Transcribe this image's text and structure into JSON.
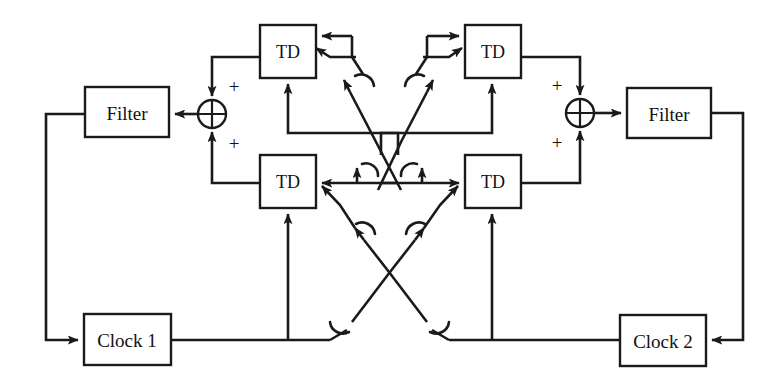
{
  "diagram": {
    "type": "block-diagram",
    "blocks": [
      {
        "id": "filter_left",
        "label": "Filter",
        "x": 85,
        "y": 87,
        "w": 84,
        "h": 50
      },
      {
        "id": "filter_right",
        "label": "Filter",
        "x": 627,
        "y": 88,
        "w": 84,
        "h": 50
      },
      {
        "id": "td_tl",
        "label": "TD",
        "x": 260,
        "y": 25,
        "w": 56,
        "h": 53
      },
      {
        "id": "td_bl",
        "label": "TD",
        "x": 260,
        "y": 155,
        "w": 56,
        "h": 53
      },
      {
        "id": "td_tr",
        "label": "TD",
        "x": 465,
        "y": 25,
        "w": 56,
        "h": 53
      },
      {
        "id": "td_br",
        "label": "TD",
        "x": 465,
        "y": 155,
        "w": 56,
        "h": 53
      },
      {
        "id": "clock1",
        "label": "Clock 1",
        "x": 84,
        "y": 314,
        "w": 87,
        "h": 51
      },
      {
        "id": "clock2",
        "label": "Clock 2",
        "x": 620,
        "y": 315,
        "w": 86,
        "h": 51
      }
    ],
    "summing_junctions": [
      {
        "id": "sum_left",
        "cx": 212,
        "cy": 114,
        "r": 14,
        "sign_top": "+",
        "sign_bottom": "+"
      },
      {
        "id": "sum_right",
        "cx": 580,
        "cy": 113,
        "r": 14,
        "sign_top": "+",
        "sign_bottom": "+"
      }
    ],
    "signs": {
      "left_top": "+",
      "left_bottom": "+",
      "right_top": "+",
      "right_bottom": "+"
    },
    "colors": {
      "line": "#1a1a1a",
      "block_fill": "#ffffff",
      "background": "#ffffff",
      "text": "#111111"
    },
    "wire_hops": 8,
    "crossings": [
      {
        "id": "upper-cross",
        "description": "TD-top outputs cross between left and right halves"
      },
      {
        "id": "lower-cross",
        "description": "clock lines cross between left and right halves"
      }
    ]
  }
}
